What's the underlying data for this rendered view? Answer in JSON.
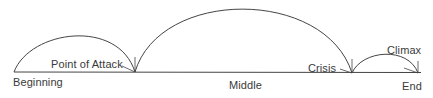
{
  "diagram": {
    "type": "plot-structure",
    "line_color": "#444444",
    "text_color": "#3a3a3a",
    "labels": {
      "beginning": "Beginning",
      "point_of_attack": "Point of Attack",
      "middle": "Middle",
      "crisis": "Crisis",
      "climax": "Climax",
      "end": "End"
    },
    "arcs": [
      {
        "name": "beginning-arc",
        "from": "Beginning",
        "to": "Point of Attack"
      },
      {
        "name": "middle-arc",
        "from": "Point of Attack",
        "to": "Crisis"
      },
      {
        "name": "climax-arc",
        "from": "Crisis",
        "to": "End"
      }
    ]
  }
}
